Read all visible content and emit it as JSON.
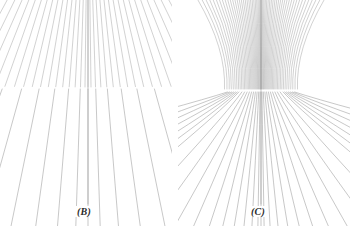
{
  "figure": {
    "name": "texture-gradient-figure",
    "background": "#ffffff",
    "width": 350,
    "height": 226,
    "line_color": "#8d8d8d",
    "line_width": 0.6,
    "label_color": "#2b2b2b"
  },
  "panels": [
    {
      "id": "b",
      "label": "(B)",
      "kind": "straight-radial-lines",
      "description": "Straight lines radiating from a vanishing point above the top edge, producing a linear perspective texture gradient.",
      "x": 0,
      "width": 172,
      "vanishing_point": {
        "x": 88,
        "y": -150
      },
      "center_line_x": 88,
      "break_band_y": 88,
      "line_count": 64
    },
    {
      "id": "c",
      "label": "(C)",
      "kind": "curved-radial-lines",
      "description": "Lines that descend steeply then bend outward, producing a curved-surface texture gradient.",
      "x": 178,
      "width": 172,
      "vanishing_point": {
        "x": 83,
        "y": -120
      },
      "center_line_x": 83,
      "break_band_y": 90,
      "bend_y": 92,
      "line_count": 56
    }
  ],
  "chart_data": {
    "type": "line",
    "title": "",
    "xlabel": "",
    "ylabel": "",
    "grid": false,
    "legend": null,
    "annotations": [
      "(B)",
      "(C)"
    ],
    "series": [
      {
        "name": "panel-B-rays",
        "values": []
      },
      {
        "name": "panel-C-rays",
        "values": []
      }
    ]
  }
}
